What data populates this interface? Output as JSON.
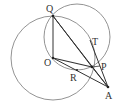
{
  "diagram": {
    "type": "geometry",
    "points": {
      "Q": {
        "label": "Q",
        "x": 53,
        "y": 16
      },
      "O": {
        "label": "O",
        "x": 53,
        "y": 58
      },
      "P": {
        "label": "P",
        "x": 92,
        "y": 67
      },
      "A": {
        "label": "A",
        "x": 108,
        "y": 87
      },
      "T": {
        "label": "T",
        "x": 90,
        "y": 37
      },
      "R": {
        "label": "R",
        "x": 77,
        "y": 71
      }
    },
    "circles": [
      {
        "name": "circle-O",
        "cx": 53,
        "cy": 58,
        "r": 42
      },
      {
        "name": "circle-QOP",
        "cx": 77,
        "cy": 37,
        "r": 33
      }
    ],
    "segments": [
      "QO",
      "QP",
      "QA",
      "OP",
      "OA",
      "TA"
    ],
    "colors": {
      "line": "#333333",
      "circle": "#666666"
    }
  }
}
